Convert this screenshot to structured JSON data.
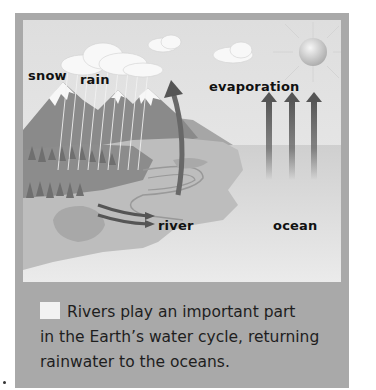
{
  "figure": {
    "labels": {
      "snow": "snow",
      "rain": "rain",
      "evaporation": "evaporation",
      "river": "river",
      "ocean": "ocean"
    },
    "caption": {
      "line1": "Rivers play an important part",
      "line2": "in the Earth’s water cycle, returning",
      "line3": "rainwater to the oceans."
    },
    "icons": [
      "cloud-icon",
      "sun-icon",
      "up-arrow-icon",
      "river-arrow-icon"
    ],
    "colors": {
      "frame": "#a9a9a9",
      "sky": "#e6e6e6",
      "ocean": "#dadada",
      "land": "#bdbdbd",
      "mountain": "#8a8a8a",
      "arrow": "#5e5e5e",
      "text": "#111111"
    }
  }
}
